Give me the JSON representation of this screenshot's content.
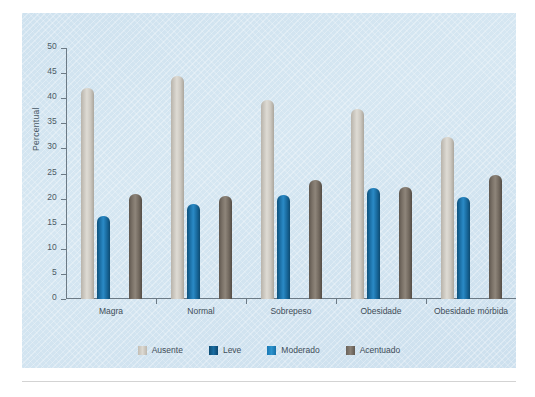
{
  "chart_data": {
    "type": "bar",
    "title": "",
    "xlabel": "",
    "ylabel": "Percentual",
    "ylim": [
      0,
      50
    ],
    "yticks": [
      0,
      5,
      10,
      15,
      20,
      25,
      30,
      35,
      40,
      45,
      50
    ],
    "ytick_labels": [
      "0",
      "5",
      "10",
      "15",
      "20",
      "25",
      "30",
      "35",
      "40",
      "45",
      "50"
    ],
    "grid": false,
    "legend_position": "bottom",
    "categories": [
      "Magra",
      "Normal",
      "Sobrepeso",
      "Obesidade",
      "Obesidade mórbida"
    ],
    "series": [
      {
        "name": "Ausente",
        "color": "#cbc7bf",
        "values": [
          42.0,
          44.5,
          39.7,
          37.8,
          32.2
        ]
      },
      {
        "name": "Leve",
        "color": "#1b6fa5",
        "values": [
          16.5,
          19.0,
          20.8,
          22.2,
          20.3
        ]
      },
      {
        "name": "Moderado",
        "color": "#1d76ad",
        "values": [
          19.8,
          15.2,
          15.2,
          16.8,
          21.3
        ]
      },
      {
        "name": "Acentuado",
        "color": "#7a7167",
        "values": [
          21.0,
          20.5,
          23.7,
          22.4,
          24.7
        ]
      }
    ]
  },
  "legend": {
    "items": [
      {
        "label": "Ausente"
      },
      {
        "label": "Leve"
      },
      {
        "label": "Moderado"
      },
      {
        "label": "Acentuado"
      }
    ]
  }
}
